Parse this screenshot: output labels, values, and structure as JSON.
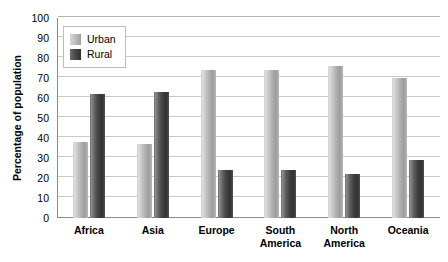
{
  "chart_data": {
    "type": "bar",
    "title": "",
    "xlabel": "",
    "ylabel": "Percentage of population",
    "ylim": [
      0,
      100
    ],
    "ytick_step": 10,
    "yticks": [
      100,
      90,
      80,
      70,
      60,
      50,
      40,
      30,
      20,
      10,
      0
    ],
    "grid": true,
    "legend_position": "top-left inside plot",
    "categories": [
      "Africa",
      "Asia",
      "Europe",
      "South\nAmerica",
      "North\nAmerica",
      "Oceania"
    ],
    "series": [
      {
        "name": "Urban",
        "color": "#c0c0c0",
        "values": [
          38,
          37,
          74,
          74,
          76,
          70
        ]
      },
      {
        "name": "Rural",
        "color": "#404040",
        "values": [
          62,
          63,
          24,
          24,
          22,
          29
        ]
      }
    ]
  },
  "legend": {
    "items": [
      {
        "label": "Urban",
        "swatch": "urban-swatch"
      },
      {
        "label": "Rural",
        "swatch": "rural-swatch"
      }
    ]
  }
}
